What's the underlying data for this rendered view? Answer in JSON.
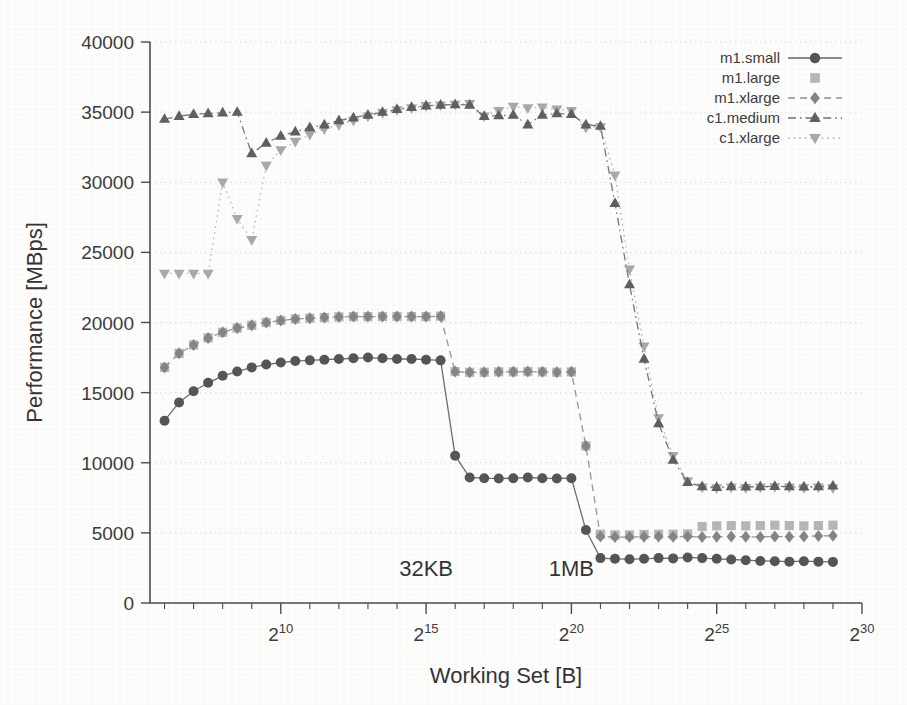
{
  "chart_data": {
    "type": "scatter",
    "title": "",
    "xlabel": "Working Set [B]",
    "ylabel": "Performance [MBps]",
    "xlim_log2": [
      5.5,
      30
    ],
    "ylim": [
      0,
      40000
    ],
    "grid": true,
    "x_major_ticks": [
      "2^10",
      "2^15",
      "2^20",
      "2^25",
      "2^30"
    ],
    "x_major_ticks_log2": [
      10,
      15,
      20,
      25,
      30
    ],
    "x_tick_labels": [
      {
        "base": "2",
        "exp": "10"
      },
      {
        "base": "2",
        "exp": "15"
      },
      {
        "base": "2",
        "exp": "20"
      },
      {
        "base": "2",
        "exp": "25"
      },
      {
        "base": "2",
        "exp": "30"
      }
    ],
    "y_ticks": [
      0,
      5000,
      10000,
      15000,
      20000,
      25000,
      30000,
      35000,
      40000
    ],
    "y_tick_labels": [
      "0",
      "5000",
      "10000",
      "15000",
      "20000",
      "25000",
      "30000",
      "35000",
      "40000"
    ],
    "annotations": [
      {
        "text": "32KB",
        "x_log2": 15.0,
        "y": 1900
      },
      {
        "text": "1MB",
        "x_log2": 20.0,
        "y": 1900
      }
    ],
    "legend": {
      "position": "top-right",
      "entries": [
        {
          "name": "m1.small",
          "marker": "circle",
          "color": "#555555",
          "line": "solid"
        },
        {
          "name": "m1.large",
          "marker": "square",
          "color": "#b6b6b6",
          "line": "none"
        },
        {
          "name": "m1.xlarge",
          "marker": "diamond",
          "color": "#858585",
          "line": "dashed"
        },
        {
          "name": "c1.medium",
          "marker": "triangle-up",
          "color": "#5f5f5f",
          "line": "dashdot"
        },
        {
          "name": "c1.xlarge",
          "marker": "triangle-down",
          "color": "#a9a9a9",
          "line": "dotted"
        }
      ]
    },
    "x_log2": [
      6.0,
      6.5,
      7.0,
      7.5,
      8.0,
      8.5,
      9.0,
      9.5,
      10.0,
      10.5,
      11.0,
      11.5,
      12.0,
      12.5,
      13.0,
      13.5,
      14.0,
      14.5,
      15.0,
      15.5,
      16.0,
      16.5,
      17.0,
      17.5,
      18.0,
      18.5,
      19.0,
      19.5,
      20.0,
      20.5,
      21.0,
      21.5,
      22.0,
      22.5,
      23.0,
      23.5,
      24.0,
      24.5,
      25.0,
      25.5,
      26.0,
      26.5,
      27.0,
      27.5,
      28.0,
      28.5,
      29.0
    ],
    "series": [
      {
        "name": "m1.small",
        "marker": "circle",
        "color": "#555555",
        "line": "solid",
        "values": [
          13000,
          14300,
          15100,
          15700,
          16200,
          16500,
          16800,
          17000,
          17150,
          17250,
          17300,
          17350,
          17400,
          17450,
          17500,
          17450,
          17400,
          17400,
          17350,
          17300,
          10500,
          8950,
          8900,
          8880,
          8900,
          8950,
          8900,
          8880,
          8900,
          5200,
          3200,
          3150,
          3120,
          3150,
          3200,
          3180,
          3250,
          3200,
          3150,
          3100,
          3050,
          3000,
          2980,
          2950,
          2980,
          2950,
          2930
        ]
      },
      {
        "name": "m1.large",
        "marker": "square",
        "color": "#b6b6b6",
        "line": "none",
        "values": [
          16800,
          17800,
          18400,
          18900,
          19300,
          19600,
          19800,
          20000,
          20150,
          20250,
          20300,
          20350,
          20400,
          20420,
          20420,
          20430,
          20430,
          20420,
          20420,
          20450,
          16500,
          16450,
          16450,
          16480,
          16480,
          16500,
          16480,
          16450,
          16480,
          11200,
          4900,
          4850,
          4850,
          4880,
          4900,
          4900,
          4920,
          5450,
          5500,
          5520,
          5500,
          5520,
          5550,
          5520,
          5500,
          5520,
          5550
        ]
      },
      {
        "name": "m1.xlarge",
        "marker": "diamond",
        "color": "#858585",
        "line": "dashed",
        "values": [
          16800,
          17800,
          18400,
          18900,
          19300,
          19600,
          19800,
          20000,
          20150,
          20250,
          20300,
          20350,
          20400,
          20420,
          20420,
          20430,
          20430,
          20420,
          20420,
          20450,
          16500,
          16450,
          16450,
          16480,
          16480,
          16500,
          16480,
          16450,
          16480,
          11200,
          4750,
          4700,
          4700,
          4720,
          4750,
          4720,
          4750,
          4700,
          4720,
          4750,
          4720,
          4700,
          4750,
          4720,
          4750,
          4780,
          4800
        ]
      },
      {
        "name": "c1.medium",
        "marker": "triangle-up",
        "color": "#5f5f5f",
        "line": "dashdot",
        "values": [
          34500,
          34700,
          34850,
          34900,
          34950,
          35000,
          32050,
          32800,
          33300,
          33600,
          33900,
          34100,
          34400,
          34600,
          34800,
          35000,
          35200,
          35350,
          35450,
          35500,
          35550,
          35500,
          34700,
          34750,
          34800,
          34100,
          34800,
          34900,
          34850,
          34100,
          34000,
          28500,
          22700,
          17400,
          12800,
          10200,
          8600,
          8300,
          8250,
          8300,
          8280,
          8300,
          8320,
          8300,
          8280,
          8300,
          8350
        ]
      },
      {
        "name": "c1.xlarge",
        "marker": "triangle-down",
        "color": "#a9a9a9",
        "line": "dotted",
        "values": [
          23500,
          23500,
          23500,
          23500,
          30000,
          27400,
          25900,
          31200,
          32300,
          32900,
          33400,
          33800,
          34100,
          34400,
          34700,
          34950,
          35150,
          35300,
          35450,
          35500,
          35550,
          35600,
          34700,
          35100,
          35400,
          35300,
          35350,
          35200,
          35100,
          33900,
          33950,
          30500,
          23800,
          18300,
          13200,
          10500,
          8700,
          8250,
          8200,
          8250,
          8220,
          8250,
          8280,
          8250,
          8220,
          8250,
          8200
        ]
      }
    ]
  },
  "figure": {
    "background": "#fdfdfc",
    "axis_color": "#4b4b4b",
    "grid_color": "#cfcfcb"
  }
}
